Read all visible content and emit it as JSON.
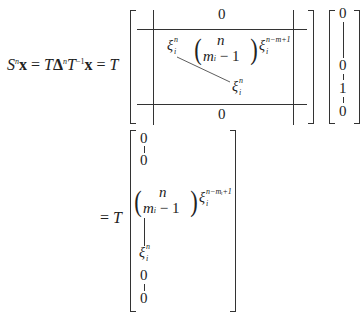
{
  "equation_line1": {
    "lhs": "Sⁿx = TΔⁿT⁻¹x = T",
    "parts": {
      "S": "S",
      "S_sup": "n",
      "x1": "x",
      "eq1": "=",
      "T1": "T",
      "Delta": "Δ",
      "Delta_sup": "n",
      "T2": "T",
      "T2_sup": "−1",
      "x2": "x",
      "eq2": "=",
      "T3": "T"
    }
  },
  "block_matrix": {
    "top_zero": "0",
    "bottom_zero": "0",
    "xi_top_left": {
      "base": "ξ",
      "sup": "n",
      "sub": "i"
    },
    "binom": {
      "top": "n",
      "bottom_m": "m",
      "bottom_sub": "i",
      "bottom_rest": "− 1"
    },
    "xi_power": {
      "base": "ξ",
      "sup": "n−m+1",
      "sub": "i"
    },
    "xi_bottom_right": {
      "base": "ξ",
      "sup": "n",
      "sub": "i"
    }
  },
  "unit_vector": {
    "entries": [
      "0",
      "0",
      "1",
      "0"
    ]
  },
  "equation_line2": {
    "eq": "=",
    "T": "T"
  },
  "result_vector": {
    "zero_top1": "0",
    "zero_top2": "0",
    "binom": {
      "top": "n",
      "bottom_m": "m",
      "bottom_sub": "i",
      "bottom_rest": "− 1"
    },
    "xi_power": {
      "base": "ξ",
      "sup": "n−mᵢ+1",
      "sub": "i"
    },
    "xi_bottom": {
      "base": "ξ",
      "sup": "n",
      "sub": "i"
    },
    "zero_bot1": "0",
    "zero_bot2": "0"
  }
}
